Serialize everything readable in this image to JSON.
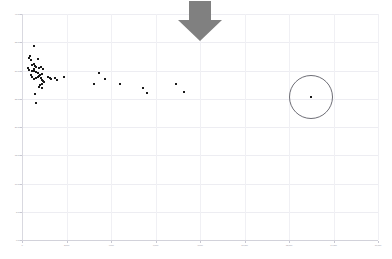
{
  "chart_data": {
    "type": "scatter",
    "title": "",
    "subtitle": "",
    "xlabel": "",
    "ylabel": "",
    "xlim": [
      0,
      16000
    ],
    "ylim": [
      0,
      40.0
    ],
    "grid": true,
    "legend": false,
    "x_ticks": [
      0,
      2000,
      4000,
      6000,
      8000,
      10000,
      12000,
      14000,
      16000
    ],
    "x_tick_labels": [
      "0",
      "2,000",
      "4,000",
      "6,000",
      "8,000",
      "10,000",
      "12,000",
      "14,000",
      "16,000"
    ],
    "y_ticks": [
      0,
      5.0,
      10.0,
      15.0,
      20.0,
      25.0,
      30.0,
      35.0,
      40.0
    ],
    "y_tick_labels": [
      "0.00",
      "5.00",
      "10.00",
      "15.00",
      "20.00",
      "25.00",
      "30.00",
      "35.00",
      "40.00"
    ],
    "marker": "square",
    "marker_color": "#1a1a1a",
    "series": [
      {
        "name": "observations",
        "points": [
          [
            310,
            30.1
          ],
          [
            520,
            34.3
          ],
          [
            360,
            32.6
          ],
          [
            330,
            32.2
          ],
          [
            420,
            31.9
          ],
          [
            700,
            32.0
          ],
          [
            250,
            30.4
          ],
          [
            560,
            31.2
          ],
          [
            470,
            31.0
          ],
          [
            600,
            30.8
          ],
          [
            640,
            30.6
          ],
          [
            520,
            30.2
          ],
          [
            430,
            30.0
          ],
          [
            560,
            29.9
          ],
          [
            620,
            29.7
          ],
          [
            700,
            29.6
          ],
          [
            780,
            30.5
          ],
          [
            860,
            30.6
          ],
          [
            950,
            30.2
          ],
          [
            880,
            29.4
          ],
          [
            810,
            29.2
          ],
          [
            760,
            29.0
          ],
          [
            700,
            28.8
          ],
          [
            620,
            28.6
          ],
          [
            540,
            28.5
          ],
          [
            470,
            28.9
          ],
          [
            400,
            29.2
          ],
          [
            840,
            28.6
          ],
          [
            900,
            28.4
          ],
          [
            960,
            28.2
          ],
          [
            1010,
            28.0
          ],
          [
            880,
            27.6
          ],
          [
            820,
            27.5
          ],
          [
            1150,
            28.8
          ],
          [
            1250,
            28.6
          ],
          [
            1320,
            28.5
          ],
          [
            1500,
            28.6
          ],
          [
            1560,
            28.4
          ],
          [
            1900,
            28.9
          ],
          [
            760,
            27.0
          ],
          [
            900,
            26.9
          ],
          [
            600,
            25.8
          ],
          [
            640,
            24.2
          ],
          [
            3450,
            29.6
          ],
          [
            3750,
            28.5
          ],
          [
            3250,
            27.6
          ],
          [
            4400,
            27.6
          ],
          [
            5450,
            26.9
          ],
          [
            5600,
            26.1
          ],
          [
            6900,
            27.6
          ],
          [
            7300,
            26.2
          ],
          [
            13000,
            25.3
          ]
        ]
      }
    ],
    "annotations": [
      {
        "type": "ellipse",
        "name": "outlier-highlight-circle",
        "center": [
          13000,
          25.3
        ],
        "color": "#6e6e76",
        "note": "circles the far-right isolated outlier point"
      },
      {
        "type": "arrow",
        "name": "down-arrow-callout",
        "direction": "down",
        "x": 8000,
        "color": "#808080",
        "note": "gray block arrow pointing down at top center of the plot"
      }
    ]
  }
}
